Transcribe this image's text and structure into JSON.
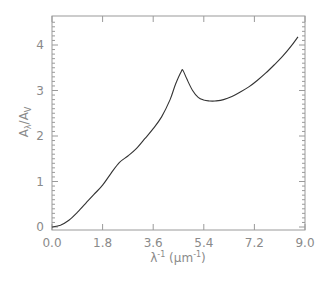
{
  "chart_data": {
    "type": "line",
    "title": "",
    "xlabel": "λ⁻¹ (µm⁻¹)",
    "xlabel_parts": {
      "lambda": "λ",
      "exp1": "-1",
      "unit_open": " (µm",
      "exp2": "-1",
      "unit_close": ")"
    },
    "ylabel": "A_λ/A_V",
    "ylabel_parts": {
      "a1": "A",
      "sub1": "λ",
      "slash": "/",
      "a2": "A",
      "sub2": "V"
    },
    "xlim": [
      0.0,
      9.0
    ],
    "ylim": [
      -0.1,
      4.5
    ],
    "xticks": [
      "0.0",
      "1.8",
      "3.6",
      "5.4",
      "7.2",
      "9.0"
    ],
    "yticks": [
      "0",
      "1",
      "2",
      "3",
      "4"
    ],
    "grid": false,
    "legend": null,
    "series": [
      {
        "name": "extinction curve",
        "color": "#333333",
        "x": [
          0.0,
          0.3,
          0.6,
          0.9,
          1.2,
          1.5,
          1.8,
          2.1,
          2.4,
          2.7,
          3.0,
          3.3,
          3.6,
          3.9,
          4.2,
          4.4,
          4.6,
          4.66,
          4.8,
          5.0,
          5.2,
          5.4,
          5.6,
          5.8,
          6.1,
          6.4,
          6.7,
          7.0,
          7.3,
          7.6,
          7.9,
          8.2,
          8.5,
          8.75
        ],
        "y": [
          0.0,
          0.04,
          0.15,
          0.32,
          0.52,
          0.72,
          0.92,
          1.18,
          1.42,
          1.56,
          1.72,
          1.94,
          2.16,
          2.42,
          2.8,
          3.15,
          3.42,
          3.44,
          3.25,
          3.0,
          2.85,
          2.79,
          2.77,
          2.77,
          2.8,
          2.87,
          2.97,
          3.08,
          3.22,
          3.38,
          3.56,
          3.75,
          3.97,
          4.18
        ]
      }
    ]
  }
}
